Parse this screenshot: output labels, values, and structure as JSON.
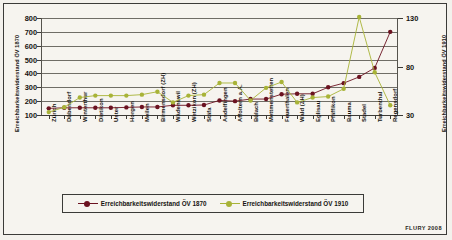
{
  "figure": {
    "credit": "FLURY 2008",
    "background": "#f6f4ef"
  },
  "legend": {
    "items": [
      {
        "label": "Erreichbarkeitswiderstand ÖV 1870",
        "color": "#6b1220"
      },
      {
        "label": "Erreichbarkeitswiderstand ÖV 1910",
        "color": "#a8b337"
      }
    ]
  },
  "chart_data": {
    "type": "line",
    "title": "",
    "xlabel": "",
    "ylabel": "Erreichbarkeitswiderstand ÖV 1870",
    "ylabel_right": "Erreichbarkeitswiderstand ÖV 1910",
    "grid": true,
    "legend_position": "bottom",
    "ylim": [
      100,
      800
    ],
    "yticks": [
      100,
      200,
      300,
      400,
      500,
      600,
      700,
      800
    ],
    "ylim_right": [
      30,
      130
    ],
    "yticks_right": [
      30,
      80,
      130
    ],
    "categories": [
      "Zürich",
      "Dübendorf",
      "Winterthur",
      "Dietikon",
      "Uster",
      "Horgen",
      "Meilen",
      "Birmensdorf (ZH)",
      "Wädenswil",
      "Wetzikon (ZH)",
      "Stäfa",
      "Andelfingen",
      "Affoltern a.A.",
      "Bülach",
      "Mettmenstetten",
      "Feuerthalen",
      "Wald (ZH)",
      "Eglisau",
      "Pfäffikon",
      "Bauma",
      "Stadel",
      "Turbenthal",
      "Regensdorf"
    ],
    "series": [
      {
        "name": "Erreichbarkeitswiderstand ÖV 1870",
        "axis": "left",
        "color": "#6b1220",
        "values": [
          148,
          152,
          152,
          152,
          152,
          155,
          158,
          158,
          170,
          170,
          172,
          205,
          200,
          215,
          215,
          250,
          253,
          253,
          300,
          330,
          375,
          440,
          700
        ]
      },
      {
        "name": "Erreichbarkeitswiderstand ÖV 1910",
        "axis": "right",
        "color": "#a8b337",
        "values": [
          33,
          38,
          48,
          50,
          50,
          50,
          51,
          54,
          43,
          50,
          51,
          63,
          63,
          45,
          58,
          64,
          43,
          48,
          49,
          57,
          131,
          74,
          40
        ]
      }
    ]
  }
}
